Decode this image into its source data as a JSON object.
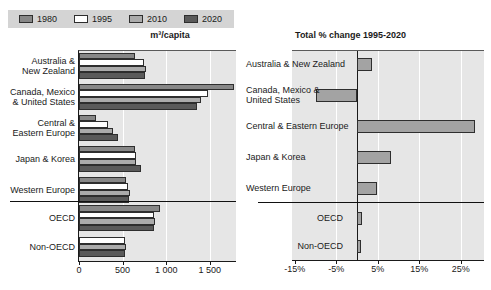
{
  "legend": {
    "items": [
      {
        "label": "1980",
        "color": "#878787"
      },
      {
        "label": "1995",
        "color": "#ffffff"
      },
      {
        "label": "2010",
        "color": "#ababab"
      },
      {
        "label": "2020",
        "color": "#5a5a5a"
      }
    ]
  },
  "chart_data": [
    {
      "type": "bar",
      "orientation": "horizontal",
      "title": "m³/capita",
      "categories": [
        "Australia &\nNew Zealand",
        "Canada, Mexico\n& United States",
        "Central &\nEastern Europe",
        "Japan & Korea",
        "Western Europe",
        "OECD",
        "Non-OECD"
      ],
      "series": [
        {
          "name": "1980",
          "values": [
            640,
            1780,
            200,
            640,
            540,
            925,
            null
          ]
        },
        {
          "name": "1995",
          "values": [
            750,
            1480,
            330,
            650,
            565,
            865,
            525
          ]
        },
        {
          "name": "2010",
          "values": [
            765,
            1400,
            390,
            650,
            590,
            875,
            535
          ]
        },
        {
          "name": "2020",
          "values": [
            760,
            1350,
            450,
            710,
            570,
            865,
            525
          ]
        }
      ],
      "xlim": [
        0,
        1800
      ],
      "xticks": [
        0,
        500,
        1000,
        1500
      ],
      "xtick_labels": [
        "0",
        "500",
        "1 000",
        "1 500"
      ],
      "gridlines": "white vertical at ticks",
      "separator_after_category": "Western Europe",
      "legend_position": "top-left"
    },
    {
      "type": "bar",
      "orientation": "horizontal",
      "title": "Total % change 1995-2020",
      "categories": [
        "Australia & New Zealand",
        "Canada, Mexico &\nUnited States",
        "Central & Eastern Europe",
        "Japan & Korea",
        "Western Europe",
        "OECD",
        "Non-OECD"
      ],
      "values": [
        3.5,
        -10,
        28.5,
        8.3,
        4.7,
        1.2,
        1.0
      ],
      "bar_color": "#a3a3a3",
      "xlim": [
        -16,
        30.6
      ],
      "xticks": [
        -15,
        -5,
        5,
        15,
        25
      ],
      "xtick_labels": [
        "-15%",
        "-5%",
        "5%",
        "15%",
        "25%"
      ],
      "gridlines": "white vertical at ticks",
      "separator_after_category": "Western Europe"
    }
  ],
  "colors": {
    "page_bg": "#ffffff",
    "plot_bg": "#e6e6e6",
    "legend_bg": "#d4d4d4",
    "axis": "#1a1a1a",
    "bar_border": "#2e2e2e",
    "gridline": "#ffffff",
    "text": "#1a1a1a"
  }
}
